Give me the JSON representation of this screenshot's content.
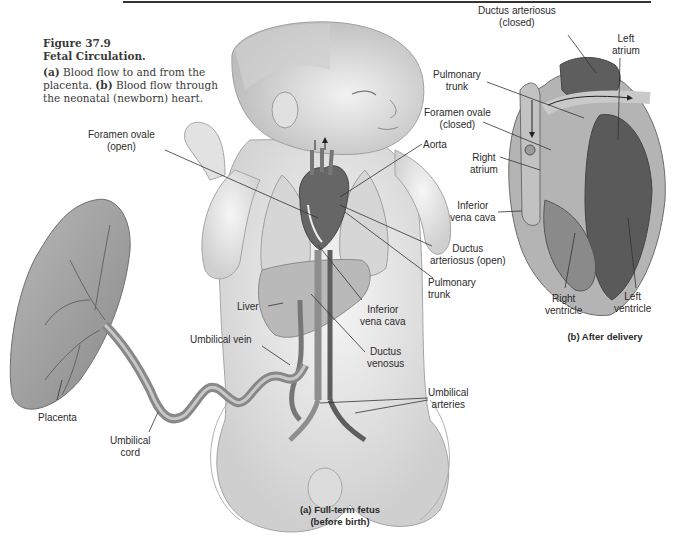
{
  "figure": {
    "number": "Figure 37.9",
    "title": "Fetal Circulation.",
    "desc_a_key": "(a)",
    "desc_a_text": " Blood flow to and from the placenta. ",
    "desc_b_key": "(b)",
    "desc_b_text": " Blood flow through the neonatal (newborn) heart."
  },
  "panel_a": {
    "title_line1": "(a) Full-term fetus",
    "title_line2": "(before birth)",
    "labels": {
      "foramen_ovale_1": "Foramen ovale",
      "foramen_ovale_2": "(open)",
      "aorta": "Aorta",
      "ductus_arteriosus_1": "Ductus",
      "ductus_arteriosus_2": "arteriosus (open)",
      "pulmonary_trunk_1": "Pulmonary",
      "pulmonary_trunk_2": "trunk",
      "liver": "Liver",
      "inferior_vena_cava_1": "Inferior",
      "inferior_vena_cava_2": "vena cava",
      "umbilical_vein": "Umbilical vein",
      "ductus_venosus_1": "Ductus",
      "ductus_venosus_2": "venosus",
      "umbilical_arteries_1": "Umbilical",
      "umbilical_arteries_2": "arteries",
      "placenta": "Placenta",
      "umbilical_cord_1": "Umbilical",
      "umbilical_cord_2": "cord"
    }
  },
  "panel_b": {
    "title": "(b) After delivery",
    "labels": {
      "ductus_arteriosus_1": "Ductus arteriosus",
      "ductus_arteriosus_2": "(closed)",
      "left_atrium_1": "Left",
      "left_atrium_2": "atrium",
      "pulmonary_trunk_1": "Pulmonary",
      "pulmonary_trunk_2": "trunk",
      "foramen_ovale_1": "Foramen ovale",
      "foramen_ovale_2": "(closed)",
      "right_atrium_1": "Right",
      "right_atrium_2": "atrium",
      "inferior_vena_cava_1": "Inferior",
      "inferior_vena_cava_2": "vena cava",
      "right_ventricle_1": "Right",
      "right_ventricle_2": "ventricle",
      "left_ventricle_1": "Left",
      "left_ventricle_2": "ventricle"
    }
  },
  "colors": {
    "rule": "#333333",
    "skin": "#ececec",
    "skin_shade": "#c9c9c9",
    "vessel_dark": "#5a5a5a",
    "vessel_light": "#b5b5b5",
    "heart_dark": "#555555",
    "heart_mid": "#7d7d7d",
    "placenta": "#9a9a9a",
    "text": "#2b2b2b"
  }
}
